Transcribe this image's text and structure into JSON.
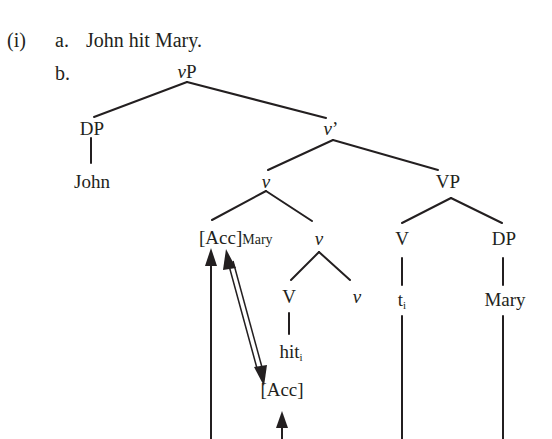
{
  "example": {
    "number": "(i)",
    "a": {
      "label": "a.",
      "sentence": "John hit Mary."
    },
    "b": {
      "label": "b."
    }
  },
  "tree": {
    "root": {
      "cat": "v",
      "suffix": "P"
    },
    "spec": {
      "label": "DP",
      "leaf": "John"
    },
    "vbar": {
      "cat": "v",
      "suffix": "’"
    },
    "v_complex": {
      "cat": "v"
    },
    "vp": {
      "label": "VP"
    },
    "acc_mary": {
      "bracket": "[Acc]",
      "sub": "Mary"
    },
    "v_inner": {
      "cat": "v"
    },
    "v_head_V": {
      "label": "V",
      "leaf": "hit",
      "index": "i"
    },
    "v_head_v": {
      "cat": "v"
    },
    "acc_feature": {
      "label": "[Acc]"
    },
    "vp_V": {
      "label": "V",
      "trace": "t",
      "index": "i"
    },
    "vp_DP": {
      "label": "DP",
      "leaf": "Mary"
    }
  },
  "colors": {
    "ink": "#231f20",
    "background": "#ffffff"
  }
}
